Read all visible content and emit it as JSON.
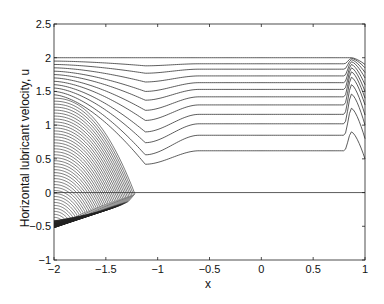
{
  "chart_data": {
    "type": "line",
    "title": "",
    "xlabel": "x",
    "ylabel": "Horizontal lubricant velocity, u",
    "xlim": [
      -2,
      1
    ],
    "ylim": [
      -1,
      2.5
    ],
    "xticks": [
      -2,
      -1.5,
      -1,
      -0.5,
      0,
      0.5,
      1
    ],
    "xtick_labels": [
      "-2",
      "-1.5",
      "-1",
      "-0.5",
      "0",
      "0.5",
      "1"
    ],
    "yticks": [
      -1,
      -0.5,
      0,
      0.5,
      1,
      1.5,
      2,
      2.5
    ],
    "ytick_labels": [
      "-1",
      "-0.5",
      "0",
      "0.5",
      "1",
      "1.5",
      "2",
      "2.5"
    ],
    "grid": false,
    "legend": null,
    "zero_line": {
      "y": 0,
      "x_range": [
        -2,
        1
      ]
    },
    "plateau_curves": {
      "description": "Curves that start at x=-2, dip near x=-1.1, settle to a flat plateau, then bump near x=0.85 before the right edge",
      "start_values": [
        2.0,
        1.95,
        1.9,
        1.85,
        1.8,
        1.75,
        1.7,
        1.65,
        1.6,
        1.55,
        1.5,
        1.45
      ],
      "plateau_values": [
        2.0,
        1.91,
        1.83,
        1.73,
        1.63,
        1.53,
        1.42,
        1.3,
        1.16,
        1.02,
        0.85,
        0.62
      ],
      "dip_values": [
        2.0,
        1.88,
        1.77,
        1.64,
        1.5,
        1.37,
        1.22,
        1.07,
        0.9,
        0.74,
        0.56,
        0.42
      ],
      "dip_x": -1.12,
      "bump_start_x": 0.8,
      "bump_peak_x": 0.87,
      "bump_peak_values": [
        2.0,
        1.99,
        1.97,
        1.94,
        1.9,
        1.85,
        1.79,
        1.71,
        1.6,
        1.46,
        1.25,
        0.9
      ],
      "right_edge_values": [
        1.9,
        1.85,
        1.78,
        1.7,
        1.6,
        1.5,
        1.4,
        1.3,
        1.15,
        1.0,
        0.8,
        0.5
      ]
    },
    "fan_curves": {
      "description": "Curves starting at x=-2 with u from ~1.4 down to -0.5, bending down to the lower envelope u≈-0.52 near x=-2 to u=0 at x≈-1.22",
      "count": 44,
      "start_max": 1.4,
      "start_min": -0.5,
      "end_x_max": -1.22,
      "envelope_min": -0.52
    }
  }
}
